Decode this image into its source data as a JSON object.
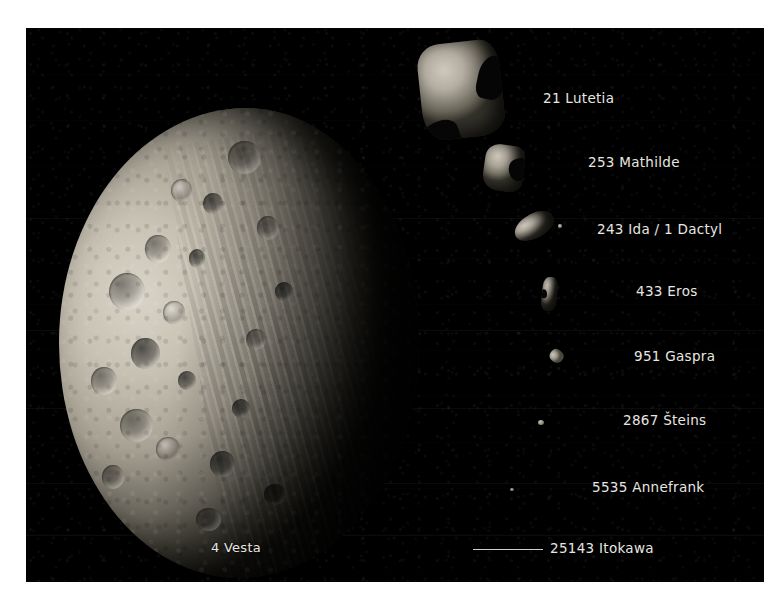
{
  "figure": {
    "type": "comparison-montage",
    "background_color": "#000000",
    "label_color": "#e8e6e0",
    "plate": {
      "x": 26,
      "y": 28,
      "width": 738,
      "height": 554
    }
  },
  "objects": [
    {
      "key": "vesta",
      "label": "4 Vesta",
      "label_x": 236,
      "label_y": 540,
      "label_align": "center",
      "shape": "large-cratered-spheroid",
      "size_class": "largest"
    },
    {
      "key": "lutetia",
      "label": "21 Lutetia",
      "label_x": 543,
      "label_y": 90,
      "label_align": "left",
      "shape": "irregular-blocky",
      "size_class": "2"
    },
    {
      "key": "mathilde",
      "label": "253 Mathilde",
      "label_x": 588,
      "label_y": 154,
      "label_align": "left",
      "shape": "irregular-lobed",
      "size_class": "3"
    },
    {
      "key": "ida",
      "label": "243 Ida  /  1 Dactyl",
      "label_x": 597,
      "label_y": 221,
      "label_align": "left",
      "shape": "elongated-potato-with-moon",
      "size_class": "4"
    },
    {
      "key": "eros",
      "label": "433 Eros",
      "label_x": 636,
      "label_y": 283,
      "label_align": "left",
      "shape": "peanut-elongated",
      "size_class": "5"
    },
    {
      "key": "gaspra",
      "label": "951 Gaspra",
      "label_x": 634,
      "label_y": 348,
      "label_align": "left",
      "shape": "small-wedge",
      "size_class": "6"
    },
    {
      "key": "steins",
      "label": "2867 Šteins",
      "label_x": 623,
      "label_y": 412,
      "label_align": "left",
      "shape": "tiny-diamond",
      "size_class": "7"
    },
    {
      "key": "annefrank",
      "label": "5535 Annefrank",
      "label_x": 592,
      "label_y": 479,
      "label_align": "left",
      "shape": "tiny-dot",
      "size_class": "8"
    },
    {
      "key": "itokawa",
      "label": "25143 Itokawa",
      "label_x": 550,
      "label_y": 540,
      "label_align": "left",
      "shape": "sub-pixel",
      "size_class": "smallest",
      "leader_line": {
        "x": 473,
        "y": 549,
        "length": 70
      }
    }
  ]
}
